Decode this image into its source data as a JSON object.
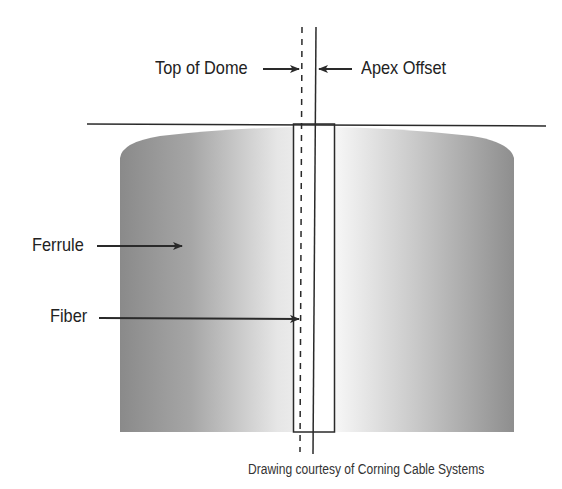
{
  "diagram": {
    "labels": {
      "top_of_dome": "Top of Dome",
      "apex_offset": "Apex Offset",
      "ferrule": "Ferrule",
      "fiber": "Fiber"
    },
    "caption": "Drawing courtesy of Corning Cable Systems",
    "colors": {
      "line": "#2a2a2a",
      "ferrule_dark": "#8e8e8e",
      "ferrule_light": "#f4f4f4",
      "background": "#ffffff"
    }
  }
}
